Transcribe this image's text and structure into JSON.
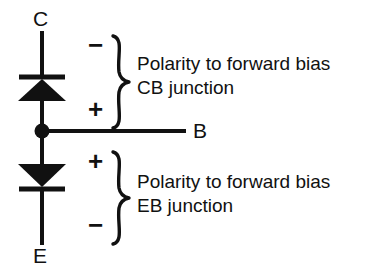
{
  "figure": {
    "kind": "transistor-two-diode-equivalent-diagram",
    "background_color": "#ffffff",
    "ink_color": "#111111"
  },
  "terminals": {
    "collector": "C",
    "base": "B",
    "emitter": "E"
  },
  "components": {
    "upper_diode": {
      "name": "cb-junction-diode",
      "orientation": "points-up",
      "cathode": "top",
      "anode": "bottom"
    },
    "lower_diode": {
      "name": "eb-junction-diode",
      "orientation": "points-down",
      "cathode": "bottom",
      "anode": "top"
    },
    "junction_dot": "base-node"
  },
  "annotations": [
    {
      "id": "cb",
      "top_sign": "−",
      "bottom_sign": "+",
      "text_line1": "Polarity to forward bias",
      "text_line2": "CB junction"
    },
    {
      "id": "eb",
      "top_sign": "+",
      "bottom_sign": "−",
      "text_line1": "Polarity to forward bias",
      "text_line2": "EB junction"
    }
  ]
}
